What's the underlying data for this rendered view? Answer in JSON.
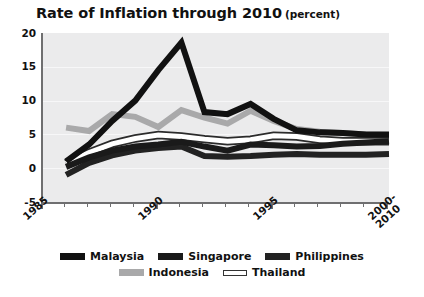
{
  "chart": {
    "title": "Rate of Inflation through 2010",
    "subtitle": "(percent)",
    "ylabel": "",
    "xlabel": ""
  },
  "axis": {
    "yticks": [
      "20",
      "15",
      "10",
      "5",
      "0",
      "-5"
    ],
    "xticks": [
      "1985",
      "1990",
      "1995",
      "2000-\n2010"
    ]
  },
  "legend": {
    "row1": [
      {
        "label": "Malaysia",
        "color": "#111111"
      },
      {
        "label": "Singapore",
        "color": "#1a1a1a"
      },
      {
        "label": "Philippines",
        "color": "#222222"
      }
    ],
    "row2": [
      {
        "label": "Indonesia",
        "color": "#a9a9aa"
      },
      {
        "label": "Thailand",
        "color": "#ffffff"
      }
    ]
  },
  "chart_data": {
    "type": "line",
    "xlabel": "",
    "ylabel": "percent",
    "ylim": [
      -5,
      20
    ],
    "xlim": [
      1985,
      2000
    ],
    "grid": true,
    "legend_position": "bottom",
    "x": [
      1986,
      1987,
      1988,
      1989,
      1990,
      1991,
      1992,
      1993,
      1994,
      1995,
      1996,
      1997,
      1998,
      1999,
      2000
    ],
    "xtick_values": [
      1985,
      1990,
      1995,
      2000
    ],
    "xtick_labels": [
      "1985",
      "1990",
      "1995",
      "2000-2010"
    ],
    "series": [
      {
        "name": "Malaysia",
        "color": "#111111",
        "values": [
          1.0,
          3.5,
          7.0,
          10.0,
          14.5,
          18.6,
          8.3,
          8.0,
          9.5,
          7.3,
          5.6,
          5.3,
          5.2,
          5.0,
          5.0
        ]
      },
      {
        "name": "Singapore",
        "color": "#1a1a1a",
        "values": [
          0.2,
          1.6,
          2.6,
          3.2,
          3.5,
          3.9,
          3.2,
          2.6,
          3.5,
          3.4,
          3.2,
          3.3,
          3.6,
          3.8,
          4.0
        ]
      },
      {
        "name": "Philippines",
        "color": "#222222",
        "values": [
          -1.0,
          0.8,
          1.9,
          2.6,
          3.0,
          3.2,
          1.8,
          1.7,
          1.8,
          2.0,
          2.1,
          2.0,
          2.0,
          2.0,
          2.1
        ]
      },
      {
        "name": "Indonesia",
        "color": "#a9a9aa",
        "values": [
          6.0,
          5.5,
          8.0,
          7.6,
          6.1,
          8.6,
          7.5,
          6.6,
          8.5,
          7.0,
          5.8,
          5.4,
          5.2,
          5.0,
          4.9
        ]
      },
      {
        "name": "Thailand",
        "color": "#ffffff",
        "values": [
          0.7,
          2.3,
          3.6,
          4.4,
          4.9,
          4.7,
          4.3,
          4.0,
          4.2,
          4.8,
          4.7,
          4.2,
          4.0,
          4.0,
          4.0
        ]
      }
    ]
  }
}
